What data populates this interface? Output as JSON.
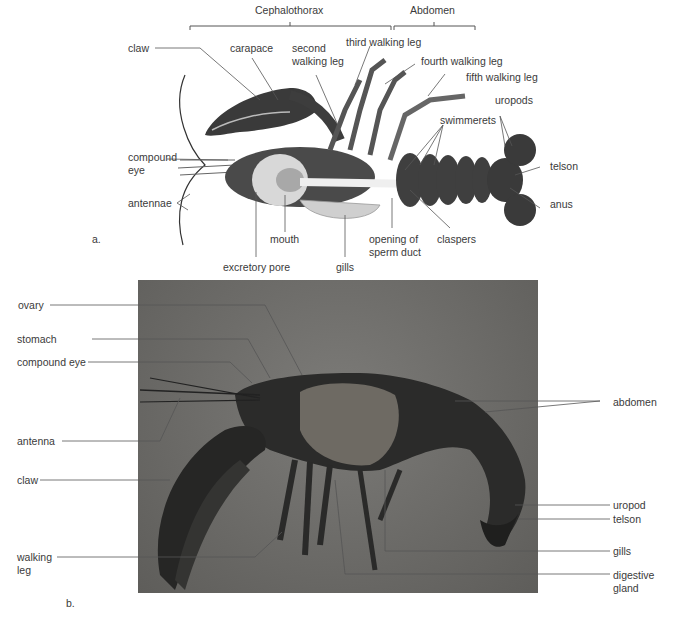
{
  "figure": {
    "panel_a": {
      "letter": "a.",
      "regions": {
        "cephalothorax": "Cephalothorax",
        "abdomen": "Abdomen"
      },
      "labels": {
        "claw": "claw",
        "carapace": "carapace",
        "second_walking_leg": "second walking leg",
        "third_walking_leg": "third walking leg",
        "fourth_walking_leg": "fourth walking leg",
        "fifth_walking_leg": "fifth walking leg",
        "uropods": "uropods",
        "swimmerets": "swimmerets",
        "telson": "telson",
        "anus": "anus",
        "compound_eye": "compound eye",
        "antennae": "antennae",
        "mouth": "mouth",
        "excretory_pore": "excretory pore",
        "gills": "gills",
        "opening_of_sperm_duct": "opening of sperm duct",
        "claspers": "claspers"
      }
    },
    "panel_b": {
      "letter": "b.",
      "labels": {
        "ovary": "ovary",
        "stomach": "stomach",
        "compound_eye": "compound eye",
        "antenna": "antenna",
        "claw": "claw",
        "walking_leg": "walking leg",
        "abdomen": "abdomen",
        "uropod": "uropod",
        "telson": "telson",
        "gills": "gills",
        "digestive_gland": "digestive gland"
      }
    }
  }
}
